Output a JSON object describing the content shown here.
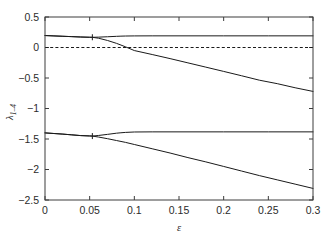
{
  "chart_data": {
    "type": "line",
    "title": "",
    "xlabel": "ε",
    "ylabel": "λ",
    "ylabel_sub": "1–4",
    "xlim": [
      0,
      0.3
    ],
    "ylim": [
      -2.5,
      0.5
    ],
    "grid": false,
    "legend": null,
    "xticks": [
      0,
      0.05,
      0.1,
      0.15,
      0.2,
      0.25,
      0.3
    ],
    "xticklabels": [
      "0",
      "0.05",
      "0.1",
      "0.15",
      "0.2",
      "0.25",
      "0.3"
    ],
    "yticks": [
      0.5,
      0,
      -0.5,
      -1,
      -1.5,
      -2,
      -2.5
    ],
    "yticklabels": [
      "0.5",
      "0",
      "−0.5",
      "−1",
      "−1.5",
      "−2",
      "−2.5"
    ],
    "line_color": "#1a1a1a",
    "reference_lines": [
      {
        "name": "zero-line",
        "orientation": "horizontal",
        "value": 0,
        "style": "dashed",
        "color": "#1a1a1a"
      }
    ],
    "annotations": [
      {
        "name": "upper-branch-point",
        "x": 0.053,
        "y": 0.168
      },
      {
        "name": "lower-branch-point",
        "x": 0.053,
        "y": -1.452
      }
    ],
    "series": [
      {
        "name": "lambda-1-upper-flat",
        "x": [
          0,
          0.01,
          0.02,
          0.03,
          0.04,
          0.05,
          0.053,
          0.06,
          0.07,
          0.08,
          0.085,
          0.09,
          0.1,
          0.12,
          0.15,
          0.2,
          0.25,
          0.3
        ],
        "values": [
          0.196,
          0.19,
          0.184,
          0.178,
          0.172,
          0.168,
          0.167,
          0.17,
          0.176,
          0.183,
          0.186,
          0.188,
          0.19,
          0.191,
          0.191,
          0.191,
          0.191,
          0.191
        ]
      },
      {
        "name": "lambda-2-upper-descending",
        "x": [
          0,
          0.01,
          0.02,
          0.03,
          0.04,
          0.05,
          0.053,
          0.06,
          0.07,
          0.08,
          0.09,
          0.1,
          0.12,
          0.14,
          0.16,
          0.18,
          0.2,
          0.22,
          0.24,
          0.26,
          0.28,
          0.3
        ],
        "values": [
          0.196,
          0.19,
          0.184,
          0.178,
          0.172,
          0.168,
          0.167,
          0.152,
          0.115,
          0.068,
          0.012,
          -0.05,
          -0.115,
          -0.182,
          -0.252,
          -0.322,
          -0.392,
          -0.463,
          -0.536,
          -0.593,
          -0.66,
          -0.72
        ]
      },
      {
        "name": "lambda-3-lower-flat",
        "x": [
          0,
          0.01,
          0.02,
          0.03,
          0.04,
          0.05,
          0.053,
          0.06,
          0.07,
          0.08,
          0.085,
          0.09,
          0.1,
          0.12,
          0.15,
          0.2,
          0.25,
          0.3
        ],
        "values": [
          -1.4,
          -1.41,
          -1.42,
          -1.432,
          -1.444,
          -1.45,
          -1.452,
          -1.442,
          -1.424,
          -1.405,
          -1.398,
          -1.392,
          -1.385,
          -1.383,
          -1.383,
          -1.383,
          -1.383,
          -1.383
        ]
      },
      {
        "name": "lambda-4-lower-descending",
        "x": [
          0,
          0.01,
          0.02,
          0.03,
          0.04,
          0.05,
          0.053,
          0.06,
          0.07,
          0.08,
          0.09,
          0.1,
          0.12,
          0.14,
          0.16,
          0.18,
          0.2,
          0.22,
          0.24,
          0.26,
          0.28,
          0.3
        ],
        "values": [
          -1.4,
          -1.41,
          -1.42,
          -1.432,
          -1.444,
          -1.45,
          -1.452,
          -1.468,
          -1.495,
          -1.525,
          -1.555,
          -1.59,
          -1.66,
          -1.73,
          -1.805,
          -1.875,
          -1.95,
          -2.025,
          -2.1,
          -2.17,
          -2.24,
          -2.31
        ]
      }
    ]
  },
  "axes": {
    "frame_color": "#3c3c3c",
    "background": "#ffffff"
  }
}
